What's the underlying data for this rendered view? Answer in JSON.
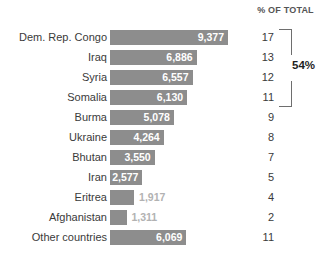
{
  "header": {
    "percent_column_label": "% OF TOTAL"
  },
  "annotation": {
    "bracket_label": "54%",
    "bracket_covers_rows": 4
  },
  "colors": {
    "bar": "#8d8d8d",
    "value_inside": "#ffffff",
    "value_outside": "#b2b2b2",
    "text": "#3a3a3a",
    "bracket": "#6e6e6e",
    "background": "#ffffff"
  },
  "chart_data": {
    "type": "bar",
    "orientation": "horizontal",
    "title": "",
    "xlabel": "",
    "ylabel": "",
    "grid": false,
    "legend": null,
    "xlim": [
      0,
      9377
    ],
    "categories": [
      "Dem. Rep. Congo",
      "Iraq",
      "Syria",
      "Somalia",
      "Burma",
      "Ukraine",
      "Bhutan",
      "Iran",
      "Eritrea",
      "Afghanistan",
      "Other countries"
    ],
    "values": [
      9377,
      6886,
      6557,
      6130,
      5078,
      4264,
      3550,
      2577,
      1917,
      1311,
      6069
    ],
    "value_labels": [
      "9,377",
      "6,886",
      "6,557",
      "6,130",
      "5,078",
      "4,264",
      "3,550",
      "2,577",
      "1,917",
      "1,311",
      "6,069"
    ],
    "label_placement": [
      "inside",
      "inside",
      "inside",
      "inside",
      "inside",
      "inside",
      "inside",
      "inside",
      "outside",
      "outside",
      "inside"
    ],
    "percent_of_total": [
      17,
      13,
      12,
      11,
      9,
      8,
      7,
      5,
      4,
      2,
      11
    ],
    "percent_labels": [
      "17",
      "13",
      "12",
      "11",
      "9",
      "8",
      "7",
      "5",
      "4",
      "2",
      "11"
    ],
    "annotations": [
      {
        "text": "54%",
        "spans_categories": [
          "Dem. Rep. Congo",
          "Iraq",
          "Syria",
          "Somalia"
        ]
      }
    ]
  }
}
